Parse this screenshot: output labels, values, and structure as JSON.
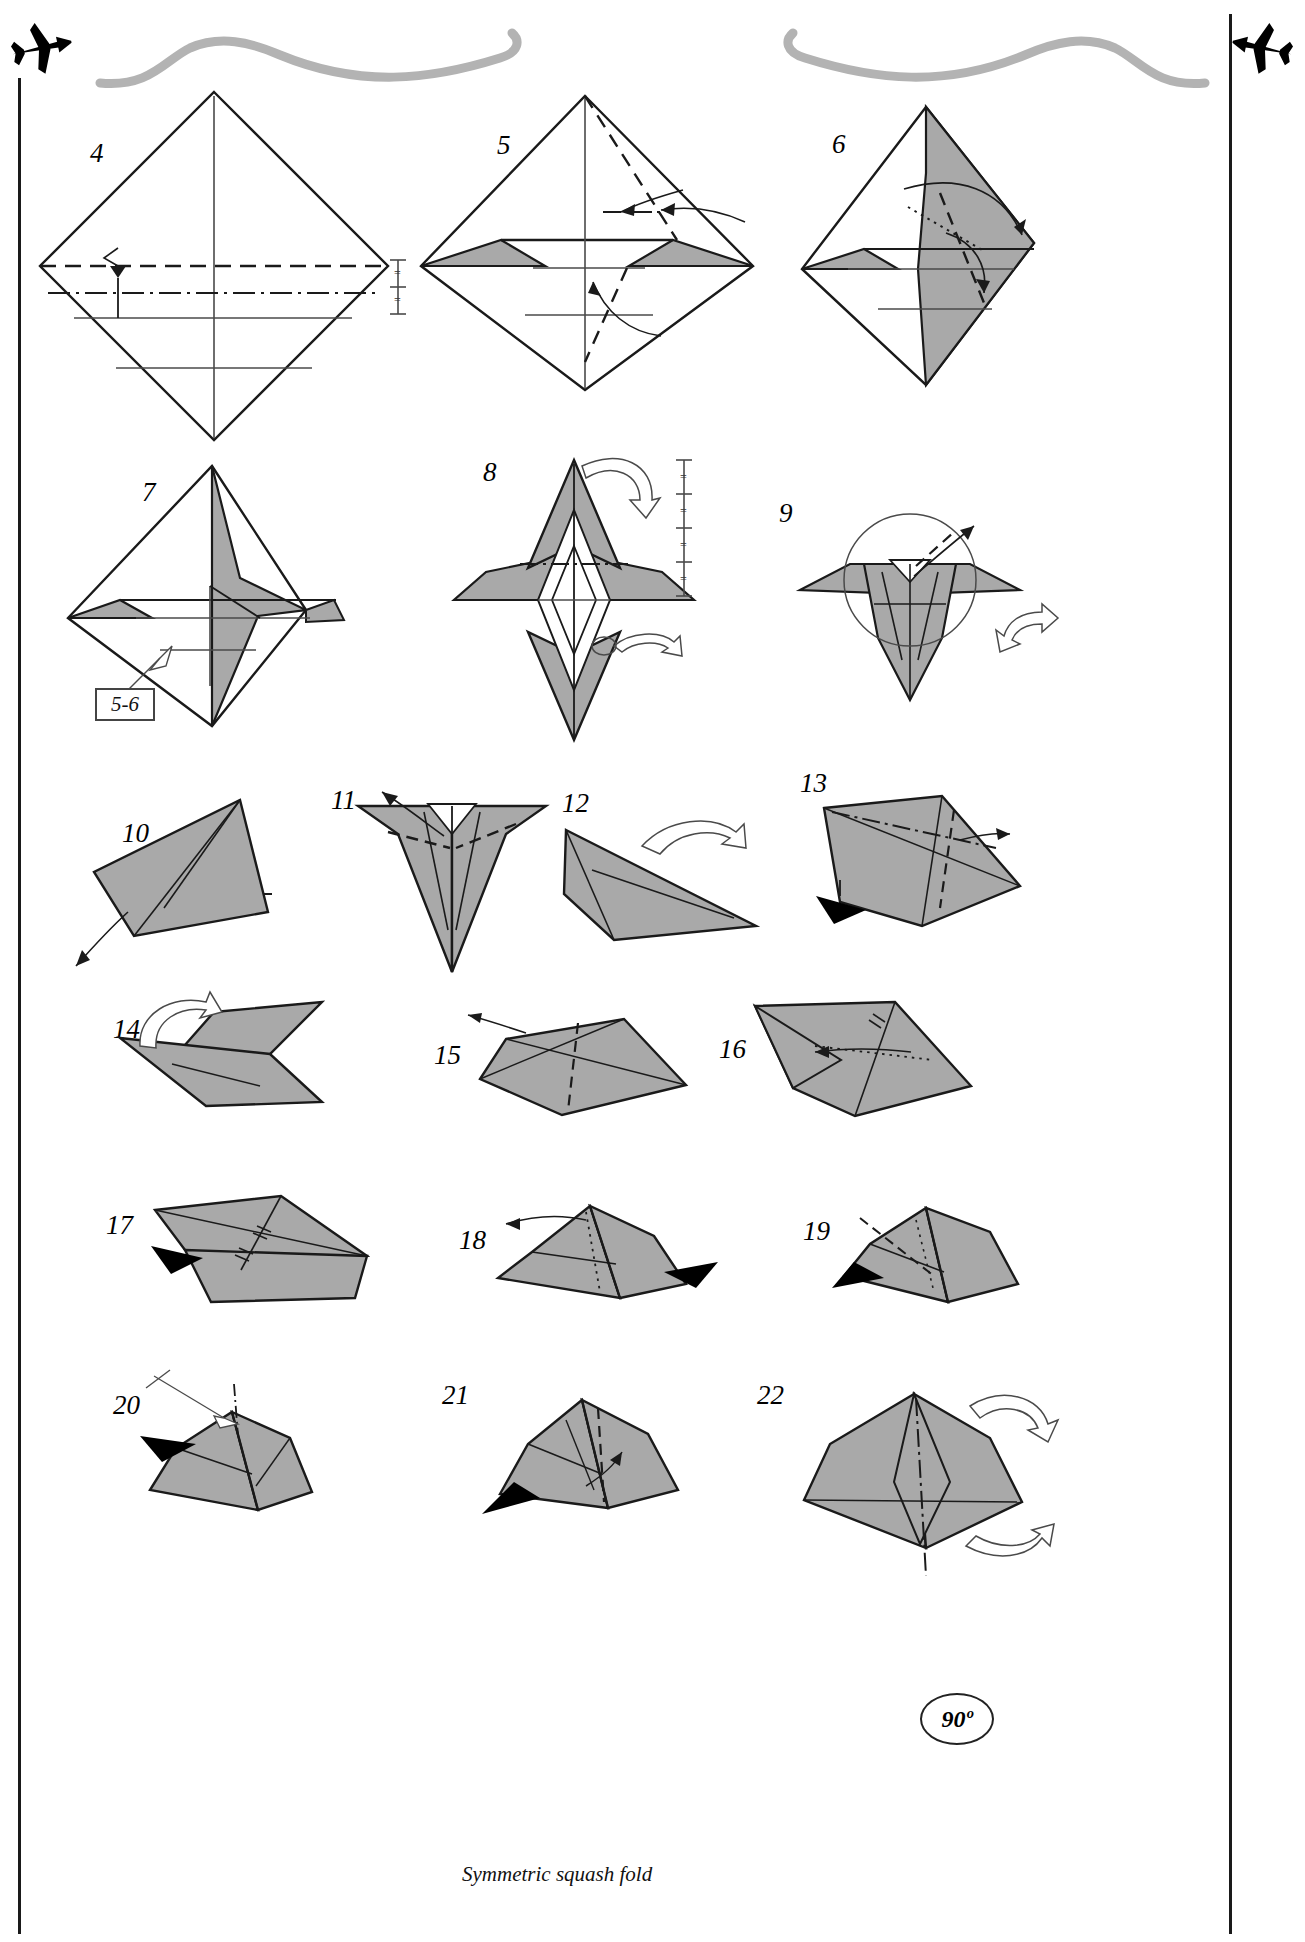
{
  "document": {
    "kind": "origami-diagram-page",
    "title": "Origami airplane folding sequence, steps 4 through 22",
    "page_background": "#ffffff"
  },
  "palette": {
    "paper_front": "#ffffff",
    "paper_back": "#a9a9a9",
    "paper_back_dark": "#9a9a9a",
    "ink": "#1a1a1a",
    "thin_ink": "#4a4a4a",
    "ornament_gray": "#b3b3b3",
    "arrow_solid": "#000000"
  },
  "header": {
    "left_icon": "airplane-icon",
    "right_icon": "airplane-icon",
    "swoosh_left": "swoosh-ornament",
    "swoosh_right": "swoosh-ornament"
  },
  "legend": {
    "valley_fold": "dashed line",
    "mountain_fold": "dash-dot line",
    "x_ray_line": "dotted line",
    "equal_marks": "=",
    "solid_arrow": "fold here",
    "hollow_arrow": "turn over / rotate",
    "push_arrow": "push in"
  },
  "steps": [
    {
      "number": "4",
      "label_x": 90,
      "label_y": 140,
      "note": "flat diamond, valley and mountain crease lines across"
    },
    {
      "number": "5",
      "label_x": 497,
      "label_y": 132,
      "note": "diamond with folded grey flap at left, curved arrows"
    },
    {
      "number": "6",
      "label_x": 832,
      "label_y": 131,
      "note": "partially folded shape, arrows to the right"
    },
    {
      "number": "7",
      "label_x": 142,
      "label_y": 479,
      "note": "kite shape with grey reverse side showing"
    },
    {
      "number": "8",
      "label_x": 483,
      "label_y": 459,
      "note": "symmetric bird-base like shape, turn-over arrows"
    },
    {
      "number": "9",
      "label_x": 779,
      "label_y": 500,
      "note": "detail circle with arrow, hollow rotate arrow right"
    },
    {
      "number": "10",
      "label_x": 122,
      "label_y": 820,
      "note": "flat grey triangle, arrow pointing down-left"
    },
    {
      "number": "11",
      "label_x": 331,
      "label_y": 787,
      "note": "inverted triangle, arrow up-left"
    },
    {
      "number": "12",
      "label_x": 562,
      "label_y": 790,
      "note": "grey triangle with hollow turn-over arrow"
    },
    {
      "number": "13",
      "label_x": 800,
      "label_y": 770,
      "note": "grey shape with mountain fold and solid push arrow"
    },
    {
      "number": "14",
      "label_x": 113,
      "label_y": 1016,
      "note": "zig-zag shape with hollow rotate arrow"
    },
    {
      "number": "15",
      "label_x": 434,
      "label_y": 1042,
      "note": "grey shape with valley fold, thin arrow up-left"
    },
    {
      "number": "16",
      "label_x": 719,
      "label_y": 1036,
      "note": "grey shape with equal marks and left arrow"
    },
    {
      "number": "17",
      "label_x": 106,
      "label_y": 1212,
      "note": "grey shape with equal marks and black push arrow"
    },
    {
      "number": "18",
      "label_x": 459,
      "label_y": 1227,
      "note": "grey shape, black push arrow from right"
    },
    {
      "number": "19",
      "label_x": 803,
      "label_y": 1218,
      "note": "grey shape, black push arrow lower-left"
    },
    {
      "number": "20",
      "label_x": 113,
      "label_y": 1392,
      "note": "grey shape, black push arrow, thin pointer"
    },
    {
      "number": "21",
      "label_x": 442,
      "label_y": 1382,
      "note": "grey shape, black push arrow, symmetric squash fold"
    },
    {
      "number": "22",
      "label_x": 757,
      "label_y": 1382,
      "note": "grey shape with hollow rotate arrows and 90 degree badge"
    }
  ],
  "annotations": {
    "ref_box": {
      "text": "5-6",
      "x": 95,
      "y": 688
    },
    "caption": {
      "text": "Symmetric squash fold",
      "x": 462,
      "y": 1862
    },
    "angle_badge": {
      "text": "90º",
      "x": 920,
      "y": 1693
    }
  },
  "measure_marks": {
    "step4_right": {
      "segments": 2,
      "glyph": "="
    },
    "step8_right": {
      "segments": 4,
      "glyph": "="
    }
  }
}
